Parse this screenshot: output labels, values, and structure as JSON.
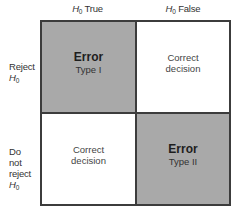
{
  "columns": [
    {
      "symbol": "H",
      "subscript": "0",
      "label": " True"
    },
    {
      "symbol": "H",
      "subscript": "0",
      "label": " False"
    }
  ],
  "rows": [
    {
      "lines": [
        "Reject"
      ],
      "symbol": "H",
      "subscript": "0"
    },
    {
      "lines": [
        "Do",
        "not",
        "reject"
      ],
      "symbol": "H",
      "subscript": "0"
    }
  ],
  "cells": {
    "reject_true": {
      "title": "Error",
      "subtitle": "Type I",
      "shaded": true
    },
    "reject_false": {
      "text": "Correct decision",
      "shaded": false
    },
    "notreject_true": {
      "text": "Correct decision",
      "shaded": false
    },
    "notreject_false": {
      "title": "Error",
      "subtitle": "Type II",
      "shaded": true
    }
  },
  "colors": {
    "shaded": "#a9a9a9",
    "border": "#3c3c3c",
    "background": "#ffffff"
  }
}
